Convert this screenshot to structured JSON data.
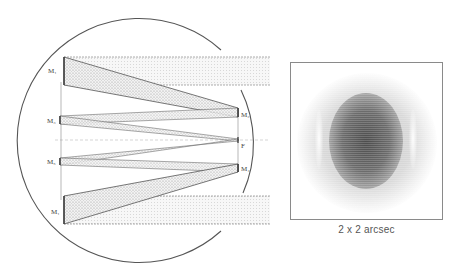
{
  "figure": {
    "left_panel": {
      "description": "Optical layout of multi-mirror telescope with folded beam paths",
      "labels": {
        "m1_top": "M₁",
        "m3": "M₃",
        "m5": "M₅",
        "m1_bottom": "M₁",
        "m2": "M₂",
        "m4": "M₄",
        "focus": "F"
      }
    },
    "right_panel": {
      "caption": "2 x 2 arcsec",
      "image": "point-spread-function"
    },
    "colors": {
      "line": "#555555",
      "fill": "#d8d8d8",
      "background": "#ffffff"
    }
  }
}
